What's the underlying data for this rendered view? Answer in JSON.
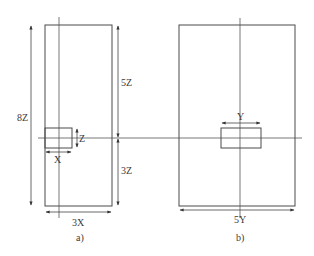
{
  "diagram": {
    "colors": {
      "line": "#4a4a4a",
      "text": "#3a3a3a",
      "background": "#ffffff"
    },
    "panel_a": {
      "caption": "a)",
      "outer_height_label": "8Z",
      "upper_height_label": "5Z",
      "lower_height_label": "3Z",
      "width_label": "3X",
      "small_rect_height_label": "Z",
      "small_rect_width_label": "X"
    },
    "panel_b": {
      "caption": "b)",
      "width_label": "5Y",
      "small_rect_width_label": "Y"
    }
  }
}
